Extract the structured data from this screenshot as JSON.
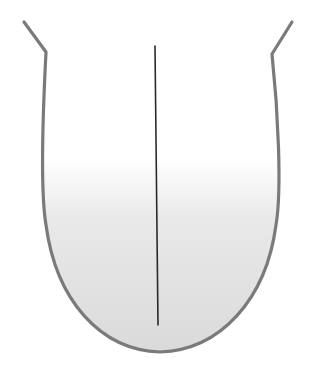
{
  "diagram": {
    "colors": {
      "background": "#ffffff",
      "outline": "#7a7a7a",
      "fill_top": "#ffffff",
      "fill_bottom": "#dcdcdc",
      "midline": "#2a2a2a"
    },
    "labels": []
  }
}
